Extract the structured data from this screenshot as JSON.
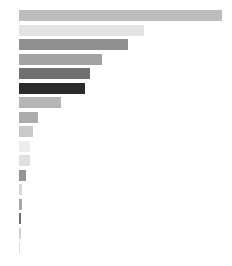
{
  "chart_data": {
    "type": "bar",
    "orientation": "horizontal",
    "title": "",
    "subtitle": "",
    "xlabel": "",
    "ylabel": "",
    "grid": false,
    "legend": null,
    "xlim": [
      0,
      215
    ],
    "background_color": "#ffffff",
    "categories": [
      "5",
      "5",
      "5",
      "5",
      "5",
      "5",
      "5",
      "5",
      "5",
      "5",
      "5",
      "5",
      "5",
      "5",
      "5",
      "5",
      "5"
    ],
    "values": [
      203,
      125,
      109,
      83,
      71,
      66,
      42,
      19,
      14,
      11,
      11,
      7,
      3,
      3,
      2,
      2,
      1
    ],
    "bar_colors": [
      "#bdbdbd",
      "#e3e3e3",
      "#8f8f8f",
      "#a3a3a3",
      "#707070",
      "#2b2b2b",
      "#b5b5b5",
      "#ababab",
      "#c9c9c9",
      "#ededed",
      "#e0e0e0",
      "#949494",
      "#d8d8d8",
      "#a8a8a8",
      "#6e6e6e",
      "#cfcfcf",
      "#dcdcdc"
    ],
    "row_pitch": 14.5,
    "bar_height": 11,
    "first_row_top": 10,
    "bar_origin_x": 19,
    "tick_label_color": "#8c8c8c",
    "tick_label_size": "6px"
  }
}
